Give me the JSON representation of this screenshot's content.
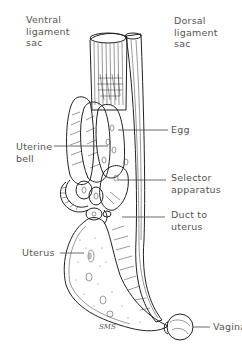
{
  "figure": {
    "signature": "SMS",
    "labels": {
      "ventral_ligament_sac": [
        "Ventral",
        "ligament",
        "sac"
      ],
      "dorsal_ligament_sac": [
        "Dorsal",
        "ligament",
        "sac"
      ],
      "egg": [
        "Egg"
      ],
      "uterine_bell": [
        "Uterine",
        "bell"
      ],
      "selector_apparatus": [
        "Selector",
        "apparatus"
      ],
      "duct_to_uterus": [
        "Duct to",
        "uterus"
      ],
      "uterus": [
        "Uterus"
      ],
      "vagina": [
        "Vagina"
      ]
    }
  }
}
